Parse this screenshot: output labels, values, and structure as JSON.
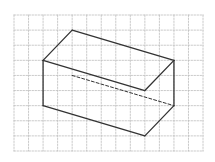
{
  "figure": {
    "type": "isometric grid drawing of a rectangular box (cuboid)",
    "grid": {
      "origin_px": [
        14,
        15
      ],
      "cols": 13,
      "rows": 9,
      "cell_w": 14.54,
      "cell_h": 15.11,
      "color": "#bdbdbd",
      "style": "dashed"
    },
    "box": {
      "color": "#333333",
      "solid_edges": [
        [
          [
            4,
            1
          ],
          [
            2,
            3
          ]
        ],
        [
          [
            4,
            1
          ],
          [
            11,
            3
          ]
        ],
        [
          [
            2,
            3
          ],
          [
            9,
            5
          ]
        ],
        [
          [
            11,
            3
          ],
          [
            9,
            5
          ]
        ],
        [
          [
            2,
            3
          ],
          [
            2,
            6
          ]
        ],
        [
          [
            2,
            6
          ],
          [
            9,
            8
          ]
        ],
        [
          [
            9,
            8
          ],
          [
            11,
            6
          ]
        ],
        [
          [
            11,
            3
          ],
          [
            11,
            6
          ]
        ]
      ],
      "hidden_edges": [
        [
          [
            4,
            4
          ],
          [
            11,
            6
          ]
        ]
      ]
    }
  }
}
